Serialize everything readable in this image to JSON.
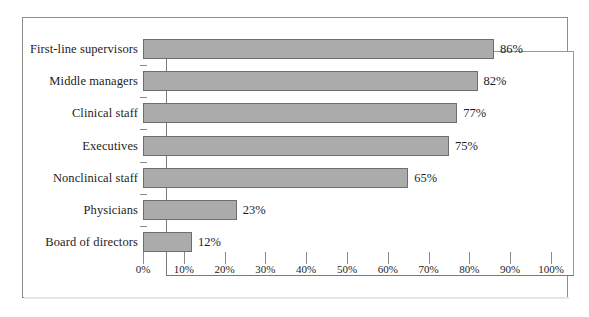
{
  "chart_data": {
    "type": "bar",
    "orientation": "horizontal",
    "title": "",
    "subtitle": "",
    "xlabel": "",
    "ylabel": "",
    "categories": [
      "First-line supervisors",
      "Middle managers",
      "Clinical staff",
      "Executives",
      "Nonclinical staff",
      "Physicians",
      "Board of directors"
    ],
    "values": [
      86,
      82,
      77,
      75,
      65,
      23,
      12
    ],
    "value_labels": [
      "86%",
      "82%",
      "77%",
      "75%",
      "65%",
      "23%",
      "12%"
    ],
    "xlim": [
      0,
      100
    ],
    "xtick_values": [
      0,
      10,
      20,
      30,
      40,
      50,
      60,
      70,
      80,
      90,
      100
    ],
    "xtick_labels": [
      "0%",
      "10%",
      "20%",
      "30%",
      "40%",
      "50%",
      "60%",
      "70%",
      "80%",
      "90%",
      "100%"
    ],
    "grid": false,
    "legend": null,
    "bar_fill_color": "#ababab",
    "bar_border_color": "#6e6e6e",
    "axis_color": "#7a7a7a",
    "text_color": "#1d1d1d",
    "background_color": "#ffffff"
  }
}
